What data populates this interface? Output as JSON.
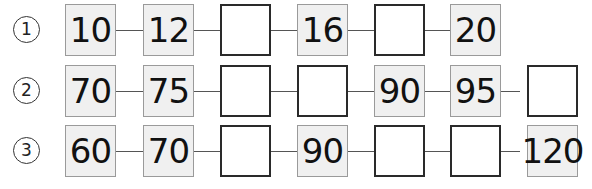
{
  "rows": [
    {
      "label": "1",
      "boxes": [
        "10",
        "12",
        "",
        "16",
        "",
        "20"
      ]
    },
    {
      "label": "2",
      "boxes": [
        "70",
        "75",
        "",
        "",
        "90",
        "95",
        ""
      ]
    },
    {
      "label": "3",
      "boxes": [
        "60",
        "70",
        "",
        "90",
        "",
        "",
        "120"
      ]
    }
  ]
}
